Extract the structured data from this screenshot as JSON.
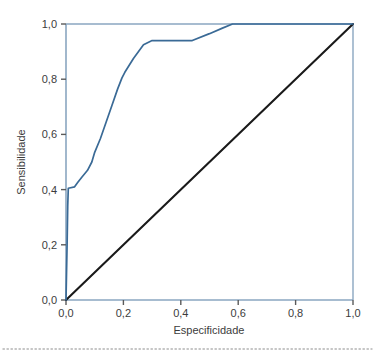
{
  "chart_data": {
    "type": "line",
    "title": "",
    "xlabel": "Especificidade",
    "ylabel": "Sensibilidade",
    "xlim": [
      0,
      1
    ],
    "ylim": [
      0,
      1
    ],
    "grid": false,
    "legend": "none",
    "decimal_separator": ",",
    "xticks": [
      "0,0",
      "0,2",
      "0,4",
      "0,6",
      "0,8",
      "1,0"
    ],
    "xtick_values": [
      0,
      0.2,
      0.4,
      0.6,
      0.8,
      1
    ],
    "yticks": [
      "0,0",
      "0,2",
      "0,4",
      "0,6",
      "0,8",
      "1,0"
    ],
    "ytick_values": [
      0,
      0.2,
      0.4,
      0.6,
      0.8,
      1
    ],
    "series": [
      {
        "name": "Curva ROC",
        "color": "#3a6a96",
        "x": [
          0.0,
          0.004,
          0.006,
          0.008,
          0.03,
          0.04,
          0.055,
          0.075,
          0.09,
          0.1,
          0.12,
          0.14,
          0.16,
          0.18,
          0.195,
          0.205,
          0.235,
          0.27,
          0.3,
          0.44,
          0.5,
          0.545,
          0.58,
          1.0
        ],
        "y": [
          0.0,
          0.21,
          0.34,
          0.405,
          0.41,
          0.425,
          0.445,
          0.47,
          0.5,
          0.535,
          0.585,
          0.645,
          0.705,
          0.765,
          0.805,
          0.825,
          0.875,
          0.925,
          0.94,
          0.94,
          0.965,
          0.985,
          1.0,
          1.0
        ]
      },
      {
        "name": "Linha de referência",
        "color": "#1a1a1a",
        "x": [
          0,
          1
        ],
        "y": [
          0,
          1
        ]
      }
    ]
  },
  "axes": {
    "x_title": "Especificidade",
    "y_title": "Sensibilidade",
    "x_tick_labels": [
      "0,0",
      "0,2",
      "0,4",
      "0,6",
      "0,8",
      "1,0"
    ],
    "y_tick_labels": [
      "0,0",
      "0,2",
      "0,4",
      "0,6",
      "0,8",
      "1,0"
    ]
  },
  "colors": {
    "roc_curve": "#3a6a96",
    "reference_line": "#1a1a1a",
    "axis_spine": "#8aa6c0",
    "tick_mark": "#5a5a5a",
    "text": "#3c3c3c",
    "divider": "#b4b4b4",
    "background": "#ffffff"
  },
  "footer": {
    "divider": "dotted-rule"
  }
}
